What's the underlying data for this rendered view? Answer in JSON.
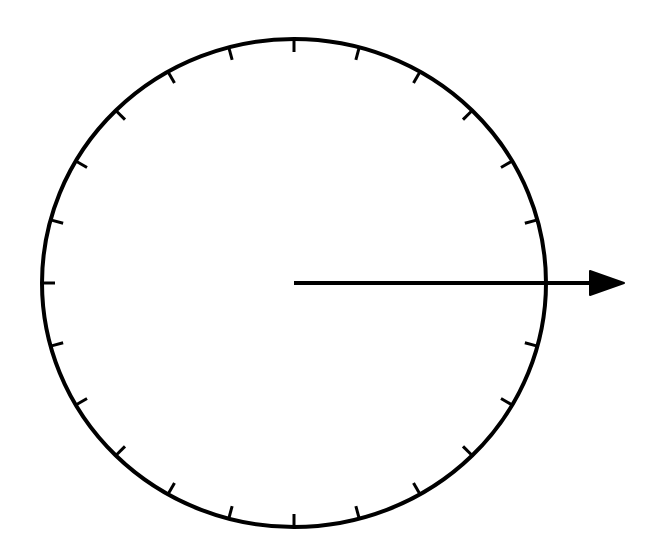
{
  "diagram": {
    "type": "dial-with-vector",
    "background": "#ffffff",
    "stroke_color": "#000000",
    "circle": {
      "cx": 294,
      "cy": 283,
      "rx": 252,
      "ry": 244,
      "stroke_width": 4
    },
    "ticks": {
      "count": 24,
      "interval_degrees": 15,
      "length": 13,
      "stroke_width": 3,
      "omitted_angles": [
        0
      ]
    },
    "arrow": {
      "x1": 294,
      "y1": 283,
      "x2": 592,
      "y2": 283,
      "stroke_width": 4,
      "head": {
        "tip_x": 624,
        "base_x": 590,
        "half_height": 12
      },
      "direction": "right"
    }
  }
}
